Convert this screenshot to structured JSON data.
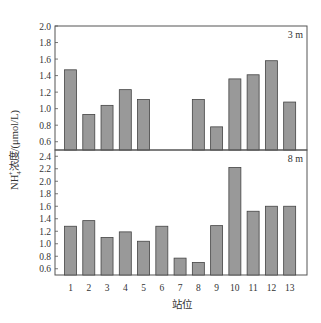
{
  "chart_data": {
    "type": "bar",
    "title": "",
    "xlabel": "站位",
    "ylabel": "NH4+浓度/(μmol/L)",
    "ylabel_parts": {
      "main": "NH",
      "sub": "4",
      "sup": "+",
      "rest": "浓度/(μmol/L)"
    },
    "categories": [
      "1",
      "2",
      "3",
      "4",
      "5",
      "6",
      "7",
      "8",
      "9",
      "10",
      "11",
      "12",
      "13"
    ],
    "bar_color": "#999999",
    "bar_edge_color": "#444444",
    "panels": [
      {
        "label": "3 m",
        "ylim": [
          0.5,
          2.0
        ],
        "yticks": [
          0.6,
          0.8,
          1.0,
          1.2,
          1.4,
          1.6,
          1.8,
          2.0
        ],
        "ytick_labels": [
          "0.6",
          "0.8",
          "1.0",
          "1.2",
          "1.4",
          "1.6",
          "1.8",
          "2.0"
        ],
        "values": [
          1.47,
          0.93,
          1.04,
          1.23,
          1.11,
          null,
          null,
          1.11,
          0.78,
          1.36,
          1.41,
          1.58,
          1.08
        ]
      },
      {
        "label": "8 m",
        "ylim": [
          0.5,
          2.5
        ],
        "yticks": [
          0.6,
          0.8,
          1.0,
          1.2,
          1.4,
          1.6,
          1.8,
          2.0,
          2.2,
          2.4
        ],
        "ytick_labels": [
          "0.6",
          "0.8",
          "1.0",
          "1.2",
          "1.4",
          "1.6",
          "1.8",
          "2.0",
          "2.2",
          "2.4"
        ],
        "values": [
          1.28,
          1.37,
          1.1,
          1.19,
          1.04,
          1.28,
          0.77,
          0.7,
          1.29,
          2.22,
          1.52,
          1.6,
          1.6
        ]
      }
    ],
    "grid": false,
    "legend": null
  }
}
